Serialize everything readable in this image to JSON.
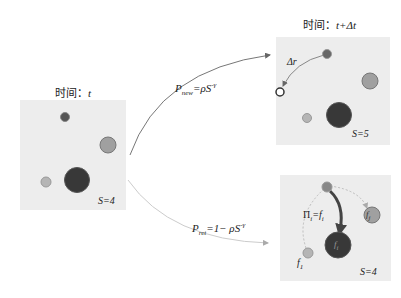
{
  "panels": {
    "left": {
      "title_prefix": "时间：",
      "title_var": "t",
      "s_label": "S=4"
    },
    "top_right": {
      "title_prefix": "时间：",
      "title_var": "t+Δt",
      "s_label": "S=5",
      "delta_label": "Δr"
    },
    "bottom_right": {
      "s_label": "S=4",
      "pi_label": "Π",
      "pi_sub": "i",
      "pi_eq": "=f",
      "pi_eq_sub": "i",
      "fi_label": "f",
      "fi_sub": "i",
      "fj_label": "f",
      "fj_sub": "j",
      "f1_label": "f",
      "f1_sub": "1"
    }
  },
  "arrows": {
    "new": {
      "p": "P",
      "sub": "new",
      "rhs": "=ρS",
      "sup": "-γ"
    },
    "ret": {
      "p": "P",
      "sub": "ret",
      "rhs": "=1− ρS",
      "sup": "-γ"
    }
  },
  "colors": {
    "panel_bg": "#ececec",
    "dark": "#3a3a3a",
    "mid": "#9a9a9a",
    "light": "#b8b8b8",
    "arrow": "#666666",
    "dashed": "#bbbbbb"
  }
}
